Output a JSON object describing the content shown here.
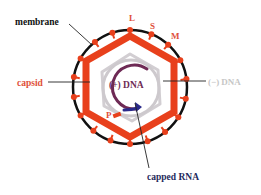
{
  "diagram": {
    "labels": {
      "membrane": "membrane",
      "capsid": "capsid",
      "protein_L": "L",
      "protein_S": "S",
      "protein_M": "M",
      "minus_dna": "(−) DNA",
      "plus_dna": "(+) DNA",
      "polymerase": "P",
      "capped_rna": "capped RNA"
    },
    "colors": {
      "membrane": "#111111",
      "capsid": "#e8401c",
      "surface_protein": "#e8401c",
      "minus_dna": "#c8c4c8",
      "plus_dna": "#6e2a55",
      "capped_rna": "#2a2a8a",
      "leader_line": "#222222",
      "minus_dna_label": "#c6c6c6",
      "capped_rna_label": "#1f2a5c"
    }
  }
}
